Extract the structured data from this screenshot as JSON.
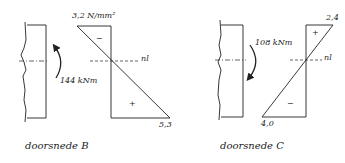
{
  "sections": [
    {
      "id": "B",
      "caption": "doorsnede B",
      "moment": "144 kNm",
      "moment_direction": "counterclockwise",
      "stress_top": "3,2 N/mm²",
      "stress_top_sign": "−",
      "stress_bottom": "5,3",
      "stress_bottom_sign": "+",
      "neutral_axis_label": "nl"
    },
    {
      "id": "C",
      "caption": "doorsnede C",
      "moment": "108 kNm",
      "moment_direction": "clockwise",
      "stress_top": "2,4",
      "stress_top_sign": "+",
      "stress_bottom": "4,0",
      "stress_bottom_sign": "−",
      "neutral_axis_label": "nl"
    }
  ],
  "colors": {
    "line": "#222222",
    "background": "#ffffff"
  }
}
